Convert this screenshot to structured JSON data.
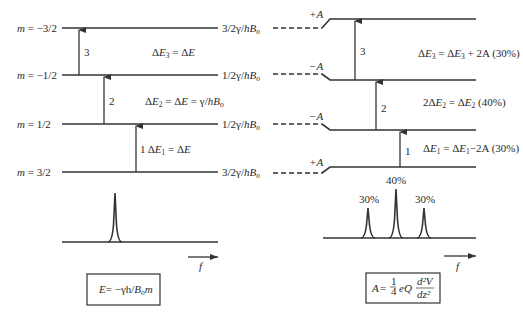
{
  "left_panel": {
    "levels": [
      {
        "m_label": "m = −3/2",
        "energy_label": "3/2γ/hBₒ",
        "y": 28
      },
      {
        "m_label": "m = −1/2",
        "energy_label": "1/2γ/hBₒ",
        "y": 75
      },
      {
        "m_label": "m = 1/2",
        "energy_label": "1/2γ/hBₒ",
        "y": 124
      },
      {
        "m_label": "m = 3/2",
        "energy_label": "3/2γ/hBₒ",
        "y": 172
      }
    ],
    "transitions": [
      {
        "number": "3",
        "label": "ΔE₃ = ΔE"
      },
      {
        "number": "2",
        "label": "ΔE₂ = ΔE = γ/hBₒ"
      },
      {
        "number": "1",
        "label": "ΔE₁ = ΔE"
      }
    ],
    "spectrum": {
      "peaks": [
        {
          "position": "center",
          "relative_height": 1.0
        }
      ],
      "axis_label": "f"
    },
    "formula": "E= −γh/Bₒm"
  },
  "right_panel": {
    "quadrupole_shifts": [
      "+A",
      "−A",
      "−A",
      "+A"
    ],
    "transitions": [
      {
        "number": "3",
        "label": "ΔE₃ = ΔE₃ + 2A (30%)"
      },
      {
        "number": "2",
        "label": "2ΔE₂ = ΔE₂ (40%)"
      },
      {
        "number": "1",
        "label": "ΔE₁ = ΔE₁−2A (30%)"
      }
    ],
    "spectrum": {
      "peaks": [
        {
          "label": "30%",
          "relative_height": 0.6
        },
        {
          "label": "40%",
          "relative_height": 1.0
        },
        {
          "label": "30%",
          "relative_height": 0.6
        }
      ],
      "axis_label": "f"
    },
    "formula": "A = 1/4 eQ d²V/dz²"
  },
  "text": {
    "m1": "m",
    "m1v": " = −3/2",
    "m2": "m",
    "m2v": " = −1/2",
    "m3": "m",
    "m3v": " = 1/2",
    "m4": "m",
    "m4v": " = 3/2",
    "e_lbl_top": "3/2γ/",
    "e_lbl_mid": "1/2γ/",
    "hB": "hB",
    "o": "o",
    "n3": "3",
    "n2": "2",
    "n1": "1",
    "plusA": "+A",
    "minusA": "−A",
    "delta": "Δ",
    "E": "E",
    "eq": " = ",
    "dE": "ΔE",
    "gamma_over": " = γ/",
    "plus2A": " + 2A (30%)",
    "minus2A": "−2A (30%)",
    "pct40": " (40%)",
    "two": "2",
    "p30": "30%",
    "p40": "40%",
    "f": "f",
    "formula_left_a": "E",
    "formula_left_b": "= −γh/",
    "formula_left_c": "B",
    "formula_left_d": "o",
    "formula_left_e": "m",
    "A": "A",
    "eqsign": " = ",
    "one": "1",
    "four": "4",
    "eQ": "eQ",
    "d2V": "d²V",
    "dz2": "dz²"
  }
}
